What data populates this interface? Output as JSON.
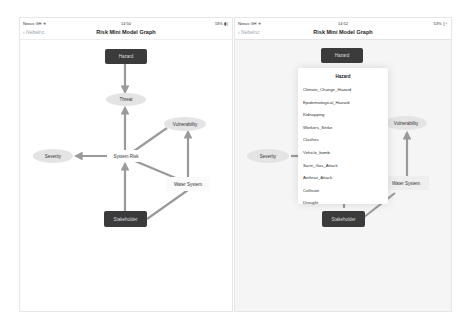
{
  "screens": [
    {
      "status_bar": {
        "carrier": "Nexus GH ✈",
        "time": "14:50",
        "battery": "53% ▮▯"
      },
      "nav": {
        "back_label": "‹ Nebelnc",
        "title": "Risk Mini Model Graph"
      },
      "nodes": {
        "hazard": "Hazard",
        "threat": "Threat",
        "vulnerability": "Vulnerability",
        "severity": "Severity",
        "system_risk": "System Risk",
        "water_system": "Water System",
        "stakeholder": "Stakeholder"
      }
    },
    {
      "status_bar": {
        "carrier": "Nexus GH ✈",
        "time": "14:52",
        "battery": "53% ▯ ›"
      },
      "nav": {
        "back_label": "‹ Nebelnc",
        "title": "Risk Mini Model Graph"
      },
      "nodes": {
        "hazard": "Hazard",
        "vulnerability": "Vulnerability",
        "severity": "Severity",
        "water_system": "Water System",
        "stakeholder": "Stakeholder"
      },
      "popup": {
        "title": "Hazard",
        "items": [
          "Climate_Change_Hazard",
          "Epidemiological_Hazard",
          "Kidnapping",
          "Workers_Strike",
          "Clashes",
          "Vehicle_bomb",
          "Sarin_Gas_Attack",
          "Anthrax_Attack",
          "Collision",
          "Drought"
        ]
      }
    }
  ],
  "colors": {
    "dark_node": "#3b3b3b",
    "ellipse_node": "#e4e4e4",
    "edge": "#9a9a9a",
    "back_link": "#9aa6b5"
  }
}
